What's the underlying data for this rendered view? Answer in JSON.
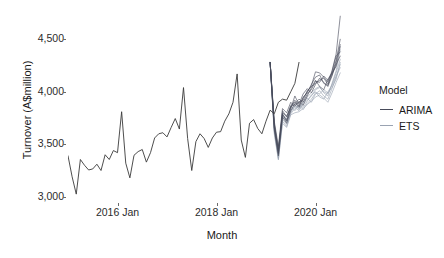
{
  "chart_data": {
    "type": "line",
    "title": "",
    "xlabel": "Month",
    "ylabel": "Turnover (A$million)",
    "ylim": [
      2950,
      4760
    ],
    "yticks": [
      3000,
      3500,
      4000,
      4500
    ],
    "ytick_labels": [
      "3,000",
      "3,500",
      "4,000",
      "4,500"
    ],
    "xtick_labels": [
      "2016 Jan",
      "2018 Jan",
      "2020 Jan"
    ],
    "xticks": [
      12,
      36,
      60
    ],
    "xlim": [
      0,
      72
    ],
    "grid": false,
    "legend": {
      "title": "Model",
      "position": "right",
      "entries": [
        {
          "name": "ARIMA",
          "color": "#474b5a"
        },
        {
          "name": "ETS",
          "color": "#9aa3b2"
        }
      ]
    },
    "history": {
      "name": "Historical turnover",
      "color": "#3a3a3a",
      "x_start": 0,
      "x_end": 49,
      "values": [
        3390,
        3190,
        3025,
        3355,
        3300,
        3255,
        3265,
        3310,
        3250,
        3400,
        3355,
        3440,
        3420,
        3810,
        3320,
        3180,
        3395,
        3430,
        3450,
        3330,
        3420,
        3560,
        3600,
        3610,
        3570,
        3660,
        3745,
        3645,
        4040,
        3555,
        3250,
        3525,
        3600,
        3555,
        3470,
        3560,
        3615,
        3620,
        3720,
        3790,
        3900,
        4170,
        3540,
        3375,
        3700,
        3735,
        3650,
        3600,
        3720,
        3825,
        3790,
        3900,
        3930,
        3920,
        4000,
        4080,
        4280
      ]
    },
    "forecast_paths": {
      "description": "Simulated future sample paths from ARIMA and ETS models",
      "x_start": 49,
      "x_end": 66,
      "arima": {
        "color": "#474b5a",
        "n_paths": 6,
        "paths": [
          [
            4280,
            3700,
            3450,
            3820,
            3760,
            3870,
            3900,
            3850,
            3940,
            4000,
            4060,
            4190,
            4180,
            4140,
            4090,
            4200,
            4360,
            4720
          ],
          [
            4280,
            3660,
            3410,
            3790,
            3720,
            3840,
            3960,
            3880,
            3980,
            4030,
            3990,
            4070,
            4130,
            4090,
            4050,
            4150,
            4280,
            4450
          ],
          [
            4280,
            3720,
            3480,
            3840,
            3800,
            3900,
            3860,
            3910,
            3870,
            3960,
            4040,
            4110,
            4050,
            4020,
            4120,
            4180,
            4240,
            4430
          ],
          [
            4280,
            3640,
            3390,
            3760,
            3700,
            3820,
            3890,
            3930,
            3900,
            3980,
            4020,
            4100,
            4090,
            4150,
            4110,
            4170,
            4300,
            4500
          ],
          [
            4280,
            3690,
            3440,
            3800,
            3770,
            3850,
            3920,
            3860,
            3950,
            3990,
            4070,
            4140,
            4160,
            4080,
            4060,
            4190,
            4340,
            4380
          ],
          [
            4280,
            3670,
            3420,
            3780,
            3730,
            3860,
            3880,
            3900,
            3920,
            4010,
            4050,
            4080,
            4110,
            4130,
            4070,
            4160,
            4260,
            4340
          ]
        ]
      },
      "ets": {
        "color": "#9aa3b2",
        "n_paths": 6,
        "paths": [
          [
            4280,
            3650,
            3400,
            3770,
            3710,
            3830,
            3850,
            3820,
            3880,
            3920,
            3960,
            4020,
            4040,
            4000,
            3980,
            4070,
            4180,
            4310
          ],
          [
            4280,
            3620,
            3370,
            3740,
            3690,
            3800,
            3870,
            3840,
            3900,
            3940,
            3900,
            3980,
            4010,
            3960,
            3930,
            4030,
            4140,
            4260
          ],
          [
            4280,
            3680,
            3430,
            3790,
            3740,
            3860,
            3820,
            3880,
            3850,
            3910,
            3970,
            4000,
            3950,
            3930,
            4000,
            4060,
            4150,
            4230
          ],
          [
            4280,
            3600,
            3350,
            3720,
            3670,
            3790,
            3840,
            3870,
            3830,
            3890,
            3930,
            3990,
            3980,
            4020,
            3990,
            4040,
            4120,
            4280
          ],
          [
            4280,
            3660,
            3390,
            3760,
            3720,
            3810,
            3880,
            3830,
            3900,
            3950,
            3990,
            4030,
            4050,
            3990,
            3960,
            4080,
            4200,
            4400
          ],
          [
            4280,
            3630,
            3360,
            3700,
            3660,
            3780,
            3800,
            3810,
            3840,
            3880,
            3910,
            3950,
            3970,
            3940,
            3900,
            3990,
            4090,
            4180
          ]
        ]
      }
    }
  },
  "panel": {
    "background": "#ffffff",
    "axis_text_color": "#2b2b2b",
    "tick_color": "#6b6b6b"
  }
}
